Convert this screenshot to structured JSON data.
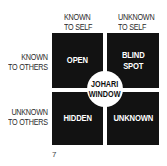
{
  "diagram": {
    "columns": [
      {
        "line1": "KNOWN",
        "line2": "TO SELF"
      },
      {
        "line1": "UNKNOWN",
        "line2": "TO SELF"
      }
    ],
    "rows": [
      {
        "line1": "KNOWN",
        "line2": "TO OTHERS"
      },
      {
        "line1": "UNKNOWN",
        "line2": "TO OTHERS"
      }
    ],
    "quadrants": [
      {
        "line1": "OPEN",
        "line2": ""
      },
      {
        "line1": "BLIND",
        "line2": "SPOT"
      },
      {
        "line1": "HIDDEN",
        "line2": ""
      },
      {
        "line1": "UNKNOWN",
        "line2": ""
      }
    ],
    "center": {
      "line1": "JOHARI",
      "line2": "WINDOW"
    },
    "page_number": "7",
    "colors": {
      "quadrant": "#121212",
      "text_on_dark": "#ffffff",
      "label": "#2a2a2a"
    }
  }
}
